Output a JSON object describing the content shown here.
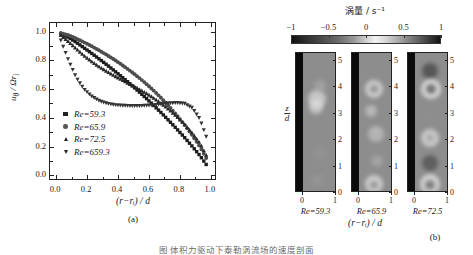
{
  "figure": {
    "caption": "图    体积力驱动下泰勒涡流场的速度剖面",
    "sublabel_a": "(a)",
    "sublabel_b": "(b)"
  },
  "panel_a": {
    "xlabel": "(r−rᵢ) / d",
    "ylabel": "uθ / Ωrᵢ",
    "xticks": [
      "0.0",
      "0.2",
      "0.4",
      "0.6",
      "0.8",
      "1.0"
    ],
    "yticks": [
      "0.0",
      "0.2",
      "0.4",
      "0.6",
      "0.8",
      "1.0"
    ],
    "xlim": [
      -0.04,
      1.04
    ],
    "ylim": [
      -0.04,
      1.06
    ],
    "legend": [
      {
        "marker": "square",
        "label": "Re=59.3"
      },
      {
        "marker": "circle",
        "label": "Re=65.9"
      },
      {
        "marker": "triangle-up",
        "label": "Re=72.5"
      },
      {
        "marker": "triangle-down",
        "label": "Re=659.3"
      }
    ]
  },
  "chart_data": {
    "type": "line",
    "title": "",
    "xlabel": "(r−rᵢ) / d",
    "ylabel": "uθ / Ωrᵢ",
    "xlim": [
      -0.04,
      1.04
    ],
    "ylim": [
      -0.04,
      1.06
    ],
    "grid": false,
    "legend_position": "lower-left",
    "x": [
      0.03,
      0.08,
      0.13,
      0.18,
      0.23,
      0.28,
      0.33,
      0.38,
      0.43,
      0.48,
      0.53,
      0.58,
      0.63,
      0.68,
      0.73,
      0.78,
      0.83,
      0.88,
      0.93,
      0.97
    ],
    "series": [
      {
        "name": "Re=59.3",
        "marker": "square",
        "values": [
          0.985,
          0.96,
          0.925,
          0.887,
          0.848,
          0.808,
          0.767,
          0.724,
          0.68,
          0.634,
          0.587,
          0.538,
          0.487,
          0.434,
          0.379,
          0.322,
          0.263,
          0.201,
          0.136,
          0.075
        ]
      },
      {
        "name": "Re=65.9",
        "marker": "circle",
        "values": [
          0.99,
          0.975,
          0.952,
          0.926,
          0.898,
          0.868,
          0.836,
          0.802,
          0.765,
          0.726,
          0.684,
          0.639,
          0.59,
          0.537,
          0.48,
          0.418,
          0.351,
          0.278,
          0.198,
          0.12
        ]
      },
      {
        "name": "Re=72.5",
        "marker": "triangle-up",
        "values": [
          0.975,
          0.93,
          0.88,
          0.833,
          0.791,
          0.754,
          0.721,
          0.69,
          0.661,
          0.632,
          0.603,
          0.572,
          0.538,
          0.5,
          0.457,
          0.409,
          0.355,
          0.294,
          0.222,
          0.14
        ]
      },
      {
        "name": "Re=659.3",
        "marker": "triangle-down",
        "values": [
          0.94,
          0.8,
          0.68,
          0.6,
          0.55,
          0.518,
          0.5,
          0.49,
          0.486,
          0.484,
          0.484,
          0.486,
          0.49,
          0.496,
          0.502,
          0.505,
          0.5,
          0.47,
          0.39,
          0.27
        ]
      }
    ]
  },
  "panel_b": {
    "colorbar_title": "涡量 / s⁻¹",
    "colorbar_ticks": [
      "−1",
      "−0.5",
      "0",
      "0.5",
      "1"
    ],
    "colorbar_range": [
      -1,
      1
    ],
    "ylabel_num": "z",
    "ylabel_den": "d",
    "yticks": [
      "0",
      "1",
      "2",
      "3",
      "4",
      "5"
    ],
    "xticks": [
      "0",
      "1"
    ],
    "xlabel": "(r−rᵢ) / d",
    "panels": [
      {
        "re_label": "Re=59.3"
      },
      {
        "re_label": "Re=65.9"
      },
      {
        "re_label": "Re=72.5"
      }
    ]
  }
}
